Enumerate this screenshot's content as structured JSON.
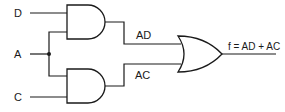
{
  "diagram": {
    "type": "logic-circuit",
    "inputs": [
      {
        "id": "D",
        "label": "D"
      },
      {
        "id": "A",
        "label": "A"
      },
      {
        "id": "C",
        "label": "C"
      }
    ],
    "gates": [
      {
        "id": "and1",
        "type": "AND",
        "inputs": [
          "D",
          "A"
        ],
        "output_label": "AD"
      },
      {
        "id": "and2",
        "type": "AND",
        "inputs": [
          "A",
          "C"
        ],
        "output_label": "AC"
      },
      {
        "id": "or1",
        "type": "OR",
        "inputs": [
          "AD",
          "AC"
        ],
        "output_label": "f = AD + AC"
      }
    ],
    "labels": {
      "input_d": "D",
      "input_a": "A",
      "input_c": "C",
      "wire_ad": "AD",
      "wire_ac": "AC",
      "output": "f = AD + AC"
    },
    "colors": {
      "stroke": "#1a1a1a",
      "background": "#ffffff"
    }
  }
}
